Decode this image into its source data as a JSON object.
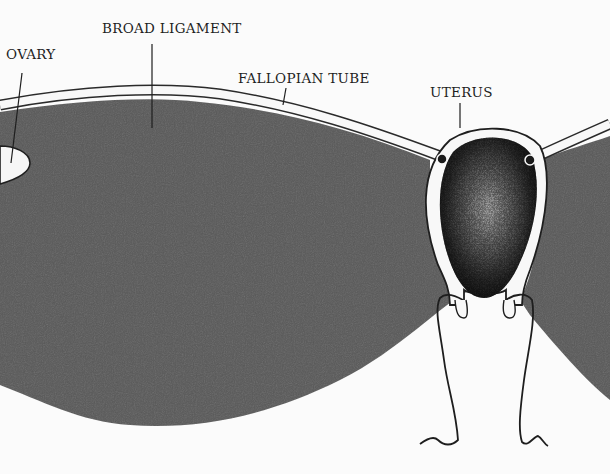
{
  "diagram": {
    "type": "anatomical-illustration",
    "colors": {
      "background": "#fbfbfb",
      "ligament_fill": "#595959",
      "outline": "#1e1e1e",
      "uterus_dark": "#1a1a1a",
      "uterus_light": "#bdbdbd"
    },
    "labels": [
      {
        "id": "ovary",
        "text": "OVARY"
      },
      {
        "id": "broad-ligament",
        "text": "BROAD LIGAMENT"
      },
      {
        "id": "fallopian-tube",
        "text": "FALLOPIAN TUBE"
      },
      {
        "id": "uterus",
        "text": "UTERUS"
      }
    ]
  }
}
